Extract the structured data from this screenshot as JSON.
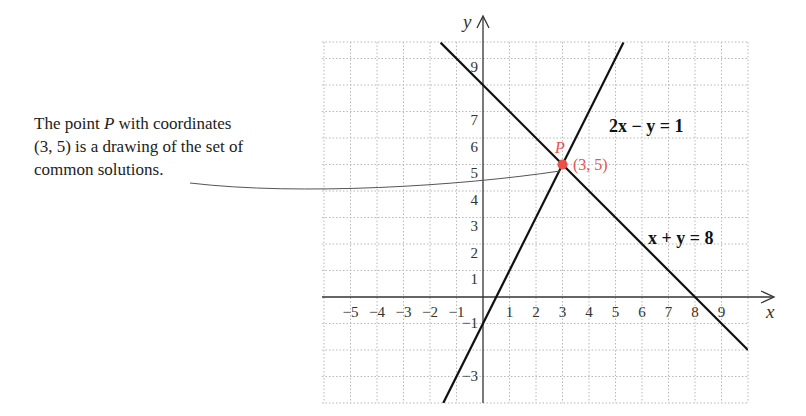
{
  "caption": {
    "line1_pre": "The point ",
    "line1_var": "P",
    "line1_post": " with coordinates",
    "line2": "(3, 5) is a drawing of the set of",
    "line3": "common solutions."
  },
  "axes": {
    "x_label": "x",
    "y_label": "y",
    "x_ticks": [
      "−5",
      "−4",
      "−3",
      "−2",
      "−1",
      "1",
      "2",
      "3",
      "4",
      "5",
      "6",
      "7",
      "8",
      "9"
    ],
    "y_ticks": [
      "9",
      "7",
      "6",
      "5",
      "4",
      "3",
      "2",
      "1",
      "−1",
      "−3"
    ]
  },
  "lines": [
    {
      "name": "line-2x-minus-y",
      "equation": "2x − y = 1"
    },
    {
      "name": "line-x-plus-y",
      "equation": "x + y = 8"
    }
  ],
  "point": {
    "name": "P",
    "coords_label": "(3, 5)",
    "color": "#e8524a"
  },
  "colors": {
    "grid": "#b8b8b8",
    "axis": "#333333",
    "line": "#111111",
    "accent": "#e8524a"
  }
}
